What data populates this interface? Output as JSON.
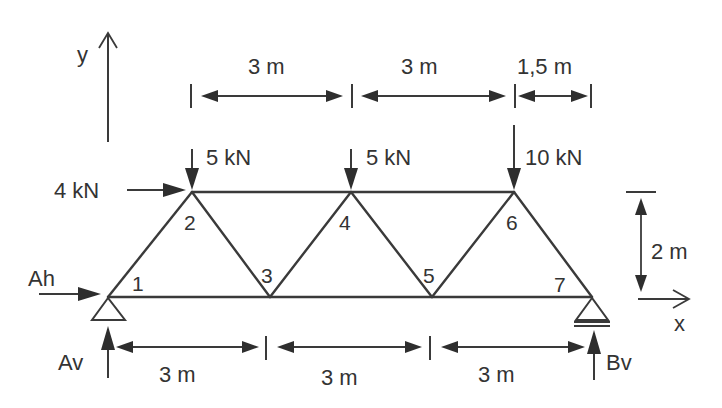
{
  "diagram": {
    "type": "plane-truss",
    "colors": {
      "background": "#ffffff",
      "lines": "#3a3a3a",
      "text": "#333333"
    },
    "axes": {
      "x_label": "x",
      "y_label": "y"
    },
    "nodes": [
      {
        "id": "1",
        "label": "1"
      },
      {
        "id": "2",
        "label": "2"
      },
      {
        "id": "3",
        "label": "3"
      },
      {
        "id": "4",
        "label": "4"
      },
      {
        "id": "5",
        "label": "5"
      },
      {
        "id": "6",
        "label": "6"
      },
      {
        "id": "7",
        "label": "7"
      }
    ],
    "members": [
      [
        "1",
        "2"
      ],
      [
        "2",
        "3"
      ],
      [
        "3",
        "4"
      ],
      [
        "4",
        "5"
      ],
      [
        "5",
        "6"
      ],
      [
        "6",
        "7"
      ],
      [
        "1",
        "3"
      ],
      [
        "3",
        "5"
      ],
      [
        "5",
        "7"
      ],
      [
        "2",
        "4"
      ],
      [
        "4",
        "6"
      ]
    ],
    "loads": {
      "horizontal_node2": "4 kN",
      "vertical_node2": "5 kN",
      "vertical_node4": "5 kN",
      "vertical_node6": "10 kN"
    },
    "reactions": {
      "A_horizontal": "Ah",
      "A_vertical": "Av",
      "B_vertical": "Bv"
    },
    "supports": {
      "A": "pin",
      "B": "roller"
    },
    "dimensions": {
      "top": [
        "3 m",
        "3 m",
        "1,5 m"
      ],
      "bottom": [
        "3 m",
        "3 m",
        "3 m"
      ],
      "height": "2 m"
    }
  }
}
